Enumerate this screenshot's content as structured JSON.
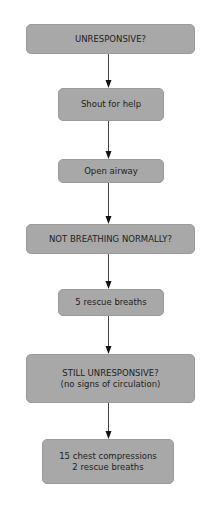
{
  "flowchart": {
    "nodes": [
      {
        "id": "unresponsive",
        "lines": [
          "UNRESPONSIVE?"
        ]
      },
      {
        "id": "shout",
        "lines": [
          "Shout for help"
        ]
      },
      {
        "id": "airway",
        "lines": [
          "Open airway"
        ]
      },
      {
        "id": "breathing",
        "lines": [
          "NOT BREATHING NORMALLY?"
        ]
      },
      {
        "id": "rescue",
        "lines": [
          "5 rescue breaths"
        ]
      },
      {
        "id": "still",
        "lines": [
          "STILL UNRESPONSIVE?",
          "(no signs of circulation)"
        ]
      },
      {
        "id": "compressions",
        "lines": [
          "15 chest compressions",
          "2 rescue breaths"
        ]
      }
    ],
    "edges": [
      {
        "from": "unresponsive",
        "to": "shout"
      },
      {
        "from": "shout",
        "to": "airway"
      },
      {
        "from": "airway",
        "to": "breathing"
      },
      {
        "from": "breathing",
        "to": "rescue"
      },
      {
        "from": "rescue",
        "to": "still"
      },
      {
        "from": "still",
        "to": "compressions"
      }
    ],
    "colors": {
      "box_fill": "#a8a8a8",
      "text": "#222222",
      "arrow": "#222222"
    }
  }
}
